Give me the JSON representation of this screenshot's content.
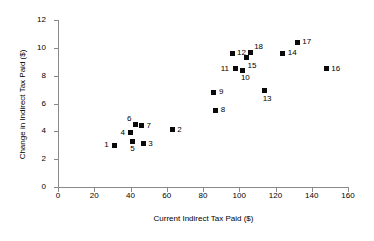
{
  "chart_data": {
    "type": "scatter",
    "title": "",
    "xlabel": "Current Indirect Tax Paid ($)",
    "ylabel": "Change in Indirect Tax Paid ($)",
    "xlim": [
      0,
      160
    ],
    "ylim": [
      0,
      12
    ],
    "xticks": [
      0,
      20,
      40,
      60,
      80,
      100,
      120,
      140,
      160
    ],
    "yticks": [
      0,
      2,
      4,
      6,
      8,
      10,
      12
    ],
    "grid": false,
    "legend": false,
    "marker": "filled-square",
    "marker_color": "#0a0a0a",
    "points": [
      {
        "label": "1",
        "x": 31,
        "y": 3.0,
        "label_pos": "left"
      },
      {
        "label": "2",
        "x": 63,
        "y": 4.1,
        "label_pos": "right"
      },
      {
        "label": "3",
        "x": 47,
        "y": 3.1,
        "label_pos": "right"
      },
      {
        "label": "4",
        "x": 40,
        "y": 3.9,
        "label_pos": "left"
      },
      {
        "label": "5",
        "x": 41,
        "y": 3.3,
        "label_pos": "below"
      },
      {
        "label": "6",
        "x": 43,
        "y": 4.5,
        "label_pos": "upper-left"
      },
      {
        "label": "7",
        "x": 46,
        "y": 4.4,
        "label_pos": "right"
      },
      {
        "label": "8",
        "x": 87,
        "y": 5.5,
        "label_pos": "right"
      },
      {
        "label": "9",
        "x": 86,
        "y": 6.8,
        "label_pos": "right"
      },
      {
        "label": "10",
        "x": 102,
        "y": 8.4,
        "label_pos": "below"
      },
      {
        "label": "11",
        "x": 98,
        "y": 8.5,
        "label_pos": "left"
      },
      {
        "label": "12",
        "x": 96,
        "y": 9.6,
        "label_pos": "right"
      },
      {
        "label": "13",
        "x": 114,
        "y": 6.9,
        "label_pos": "below"
      },
      {
        "label": "14",
        "x": 124,
        "y": 9.6,
        "label_pos": "right"
      },
      {
        "label": "15",
        "x": 104,
        "y": 9.3,
        "label_pos": "below-right"
      },
      {
        "label": "16",
        "x": 148,
        "y": 8.5,
        "label_pos": "right"
      },
      {
        "label": "17",
        "x": 132,
        "y": 10.4,
        "label_pos": "right"
      },
      {
        "label": "18",
        "x": 106,
        "y": 9.7,
        "label_pos": "upper-right"
      }
    ]
  }
}
